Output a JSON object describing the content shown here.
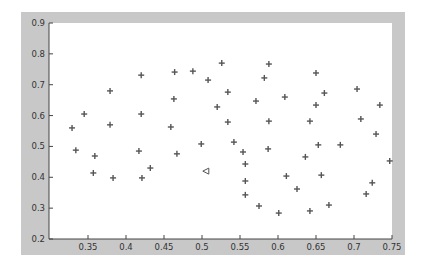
{
  "chart_data": {
    "type": "scatter",
    "title": "",
    "xlabel": "",
    "ylabel": "",
    "xlim": [
      0.315,
      0.751
    ],
    "ylim": [
      0.2,
      0.9
    ],
    "grid": false,
    "legend": null,
    "x_ticks": [
      "0.35",
      "0.4",
      "0.45",
      "0.5",
      "0.55",
      "0.6",
      "0.65",
      "0.7",
      "0.75"
    ],
    "y_ticks": [
      "0.2",
      "0.3",
      "0.4",
      "0.5",
      "0.6",
      "0.7",
      "0.8",
      "0.9"
    ],
    "series": [
      {
        "name": "points",
        "marker": "+",
        "color": "#555555",
        "x": [
          0.329,
          0.334,
          0.345,
          0.359,
          0.357,
          0.379,
          0.379,
          0.383,
          0.42,
          0.42,
          0.417,
          0.421,
          0.432,
          0.464,
          0.463,
          0.459,
          0.467,
          0.488,
          0.508,
          0.499,
          0.52,
          0.526,
          0.534,
          0.534,
          0.542,
          0.554,
          0.557,
          0.557,
          0.557,
          0.571,
          0.575,
          0.582,
          0.588,
          0.588,
          0.587,
          0.601,
          0.609,
          0.611,
          0.625,
          0.636,
          0.642,
          0.642,
          0.65,
          0.65,
          0.653,
          0.657,
          0.661,
          0.667,
          0.682,
          0.704,
          0.709,
          0.716,
          0.724,
          0.729,
          0.734,
          0.747
        ],
        "y": [
          0.56,
          0.488,
          0.605,
          0.469,
          0.414,
          0.68,
          0.57,
          0.398,
          0.731,
          0.605,
          0.485,
          0.398,
          0.43,
          0.741,
          0.654,
          0.563,
          0.476,
          0.744,
          0.715,
          0.508,
          0.628,
          0.77,
          0.676,
          0.579,
          0.514,
          0.482,
          0.443,
          0.388,
          0.343,
          0.647,
          0.307,
          0.722,
          0.767,
          0.582,
          0.492,
          0.284,
          0.66,
          0.404,
          0.362,
          0.466,
          0.582,
          0.291,
          0.738,
          0.634,
          0.505,
          0.407,
          0.673,
          0.31,
          0.505,
          0.686,
          0.589,
          0.346,
          0.382,
          0.54,
          0.634,
          0.453
        ]
      },
      {
        "name": "query",
        "marker": "triangle-left",
        "color": "#555555",
        "x": [
          0.505
        ],
        "y": [
          0.42
        ]
      }
    ]
  },
  "colors": {
    "frame": "#c8c8c8",
    "plot_bg": "#ffffff",
    "axis": "#444444",
    "marker": "#555555"
  }
}
